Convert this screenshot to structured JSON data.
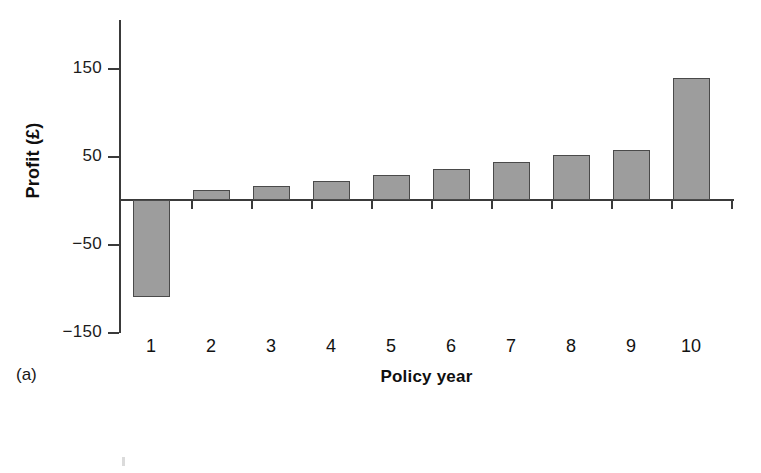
{
  "panel_label": "(a)",
  "chart_data": {
    "type": "bar",
    "title": "",
    "subtitle": "",
    "xlabel": "Policy year",
    "ylabel": "Profit (£)",
    "categories": [
      "1",
      "2",
      "3",
      "4",
      "5",
      "6",
      "7",
      "8",
      "9",
      "10"
    ],
    "values": [
      -110,
      11,
      16,
      22,
      28,
      35,
      43,
      51,
      57,
      139
    ],
    "series": [
      {
        "name": "Profit",
        "values": [
          -110,
          11,
          16,
          22,
          28,
          35,
          43,
          51,
          57,
          139
        ]
      }
    ],
    "ylim": [
      -170,
      185
    ],
    "y_ticks": [
      150,
      50,
      -50,
      -150
    ],
    "y_tick_labels": [
      "150",
      "50",
      "−50",
      "−150"
    ],
    "x_tick_labels": [
      "1",
      "2",
      "3",
      "4",
      "5",
      "6",
      "7",
      "8",
      "9",
      "10"
    ],
    "grid": false,
    "legend": false,
    "legend_position": "none",
    "bar_color": "#9d9d9d",
    "bar_edge_color": "#4a4a4a",
    "axis_color": "#3a3a3a",
    "background_color": "#ffffff",
    "zero_line": 0,
    "annotations": []
  }
}
